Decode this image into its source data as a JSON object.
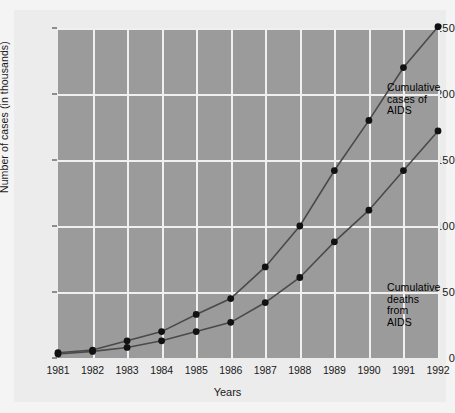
{
  "chart_data": {
    "type": "line",
    "title": "",
    "xlabel": "Years",
    "ylabel": "Number of cases (in thousands)",
    "categories": [
      "1981",
      "1982",
      "1983",
      "1984",
      "1985",
      "1986",
      "1987",
      "1988",
      "1989",
      "1990",
      "1991",
      "1992"
    ],
    "x": [
      1981,
      1982,
      1983,
      1984,
      1985,
      1986,
      1987,
      1988,
      1989,
      1990,
      1991,
      1992
    ],
    "xlim": [
      1981,
      1992
    ],
    "ylim": [
      0,
      250
    ],
    "yticks": [
      0,
      50,
      100,
      150,
      200,
      250
    ],
    "ytick_labels": [
      "0",
      "50",
      "100",
      "150",
      "200",
      "250"
    ],
    "grid": true,
    "legend_position": "inline-annotations",
    "series": [
      {
        "name": "Cumulative cases of AIDS",
        "annotation": "Cumulative\ncases of\nAIDS",
        "values": [
          4,
          6,
          13,
          20,
          33,
          45,
          69,
          100,
          142,
          180,
          220,
          251
        ],
        "marker": "filled-circle",
        "color": "#1a1a1a"
      },
      {
        "name": "Cumulative deaths from AIDS",
        "annotation": "Cumulative\ndeaths from\nAIDS",
        "values": [
          3,
          5,
          8,
          13,
          20,
          27,
          42,
          61,
          88,
          112,
          142,
          172
        ],
        "marker": "filled-circle",
        "color": "#1a1a1a"
      }
    ],
    "colors": {
      "plot_background": "#9b9b9b",
      "page_background": "#f4f4f4",
      "gridline": "#f0f0f0",
      "line": "#4a4a4a",
      "marker": "#111111",
      "text": "#1a1a1a"
    }
  }
}
